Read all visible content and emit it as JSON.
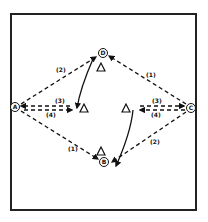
{
  "diagram": {
    "type": "drill-diagram",
    "colors": {
      "line": "#111111",
      "background": "#ffffff",
      "frame": "#222222"
    },
    "players": [
      {
        "id": "A",
        "label": "A",
        "x": 15,
        "y": 107
      },
      {
        "id": "B",
        "label": "B",
        "x": 104,
        "y": 162
      },
      {
        "id": "C",
        "label": "C",
        "x": 191,
        "y": 108
      },
      {
        "id": "D",
        "label": "D",
        "x": 103,
        "y": 53
      }
    ],
    "cones": [
      {
        "id": "cone-top",
        "x": 101,
        "y": 67
      },
      {
        "id": "cone-left",
        "x": 84,
        "y": 108
      },
      {
        "id": "cone-right",
        "x": 126,
        "y": 108
      },
      {
        "id": "cone-bottom",
        "x": 101,
        "y": 151
      }
    ],
    "pass_labels": [
      {
        "text": "(2)",
        "x": 58,
        "y": 70
      },
      {
        "text": "(1)",
        "x": 148,
        "y": 75
      },
      {
        "text": "(3)",
        "x": 57,
        "y": 101
      },
      {
        "text": "(4)",
        "x": 48,
        "y": 114
      },
      {
        "text": "(3)",
        "x": 154,
        "y": 101
      },
      {
        "text": "(4)",
        "x": 153,
        "y": 113
      },
      {
        "text": "(1)",
        "x": 70,
        "y": 149
      },
      {
        "text": "(2)",
        "x": 152,
        "y": 142
      }
    ]
  }
}
